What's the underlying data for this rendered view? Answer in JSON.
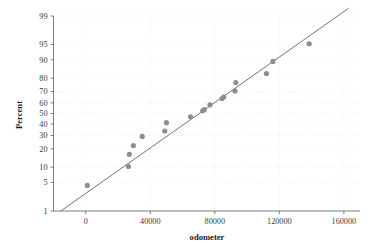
{
  "chart_data": {
    "type": "scatter",
    "title": "",
    "subtitle": "",
    "xlabel": "odometer",
    "ylabel": "Percent",
    "plot_kind": "normal-probability-plot",
    "grid": true,
    "legend": null,
    "xlim": [
      -20000,
      170000
    ],
    "ylim_percent": [
      1,
      99
    ],
    "xticks": [
      0,
      40000,
      80000,
      120000,
      160000
    ],
    "xtick_labels": [
      "0",
      "40000",
      "80000",
      "120000",
      "160000"
    ],
    "yticks": [
      1,
      5,
      10,
      20,
      30,
      40,
      50,
      60,
      70,
      80,
      90,
      95,
      99
    ],
    "ytick_labels": [
      "1",
      "5",
      "10",
      "20",
      "30",
      "40",
      "50",
      "60",
      "70",
      "80",
      "90",
      "95",
      "99"
    ],
    "point_color": "#8d8d94",
    "line_color": "#6b6b6b",
    "grid_color": "#ececf2",
    "axis_color": "#6f6f6f",
    "series": [
      {
        "name": "odometer",
        "x": [
          1000,
          26500,
          27000,
          29500,
          35000,
          49000,
          50000,
          65000,
          72500,
          73500,
          77000,
          84500,
          85500,
          92500,
          93000,
          112000,
          116000,
          138500
        ],
        "y_percent": [
          4.3,
          10.3,
          16.5,
          22.2,
          29.2,
          33.8,
          41.3,
          46.8,
          52.5,
          53.8,
          58.2,
          64.0,
          65.2,
          70.5,
          77.0,
          83.0,
          89.3,
          95.2
        ]
      }
    ],
    "fit_line": {
      "name": "normal-fit-line",
      "x": [
        -15500,
        163000
      ],
      "y_percent": [
        1,
        99.4
      ]
    }
  },
  "axes": {
    "y_title": "Percent",
    "x_title": "odometer"
  }
}
